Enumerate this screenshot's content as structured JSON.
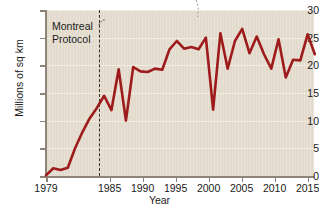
{
  "chart_data": {
    "type": "line",
    "title": "",
    "xlabel": "Year",
    "ylabel": "Millions of sq km",
    "xlim": [
      1979,
      2016
    ],
    "ylim": [
      0,
      30
    ],
    "grid": true,
    "legend": null,
    "line_color": "#9e1b1b",
    "background_color": "#e6ded0",
    "y_ticks": [
      0,
      5,
      10,
      15,
      20,
      25,
      30
    ],
    "y_tick_labels": [
      "0",
      "5",
      "10",
      "15",
      "20",
      "25",
      "30"
    ],
    "x_ticks": [
      1979,
      1985,
      1990,
      1995,
      2000,
      2005,
      2010,
      2015
    ],
    "x_tick_labels": [
      "1979",
      "1985",
      "1990",
      "1995",
      "2000",
      "2005",
      "2010",
      "2015"
    ],
    "annotations": [
      {
        "text": "Montreal\nProtocol",
        "x": 1987,
        "marker": "dashed-vertical-line"
      }
    ],
    "series": [
      {
        "name": "Antarctic ozone hole area",
        "x": [
          1979,
          1980,
          1981,
          1982,
          1983,
          1984,
          1985,
          1986,
          1987,
          1988,
          1989,
          1990,
          1991,
          1992,
          1993,
          1994,
          1995,
          1996,
          1997,
          1998,
          1999,
          2000,
          2001,
          2002,
          2003,
          2004,
          2005,
          2006,
          2007,
          2008,
          2009,
          2010,
          2011,
          2012,
          2013,
          2014,
          2015,
          2016
        ],
        "values": [
          0.1,
          1.4,
          1.1,
          1.5,
          5.0,
          7.9,
          10.4,
          12.3,
          14.5,
          11.9,
          19.3,
          10.0,
          19.7,
          18.9,
          18.8,
          19.4,
          19.2,
          22.9,
          24.4,
          23.0,
          23.3,
          22.9,
          25.0,
          12.0,
          25.8,
          19.4,
          24.4,
          26.6,
          22.2,
          25.2,
          22.0,
          19.4,
          24.7,
          17.8,
          21.0,
          20.9,
          25.6,
          22.0
        ]
      }
    ]
  }
}
